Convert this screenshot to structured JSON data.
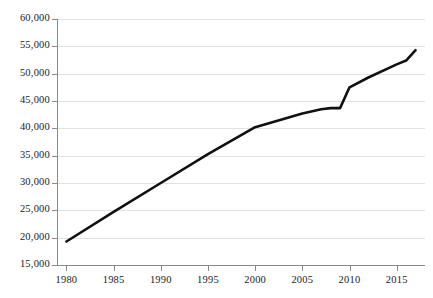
{
  "chart_data": {
    "type": "line",
    "title": "",
    "subtitle": "",
    "xlabel": "",
    "ylabel": "",
    "xlim": [
      1979,
      2018
    ],
    "ylim": [
      15000,
      60000
    ],
    "grid": true,
    "legend": false,
    "legend_position": "none",
    "y_ticks": [
      60000,
      55000,
      50000,
      45000,
      40000,
      35000,
      30000,
      25000,
      20000,
      15000
    ],
    "y_tick_labels": [
      "60,000",
      "55,000",
      "50,000",
      "45,000",
      "40,000",
      "35,000",
      "30,000",
      "25,000",
      "20,000",
      "15,000"
    ],
    "x_ticks": [
      1980,
      1985,
      1990,
      1995,
      2000,
      2005,
      2010,
      2015
    ],
    "x_tick_labels": [
      "1980",
      "1985",
      "1990",
      "1995",
      "2000",
      "2005",
      "2010",
      "2015"
    ],
    "series": [
      {
        "name": "series-1",
        "color": "#111111",
        "line_width": 2.6,
        "x": [
          1980,
          1985,
          1990,
          1995,
          2000,
          2003,
          2005,
          2007,
          2008,
          2009,
          2010,
          2012,
          2015,
          2016,
          2017
        ],
        "values": [
          19300,
          24700,
          30000,
          35300,
          40200,
          41700,
          42700,
          43500,
          43700,
          43700,
          47500,
          49300,
          51700,
          52400,
          54300
        ]
      }
    ],
    "annotations": []
  },
  "axis_colors": {
    "axis_line": "#8a8a8a",
    "gridline": "#e2e2e2",
    "tick_label": "#1b1b1b",
    "series_line": "#111111",
    "background": "#ffffff"
  }
}
